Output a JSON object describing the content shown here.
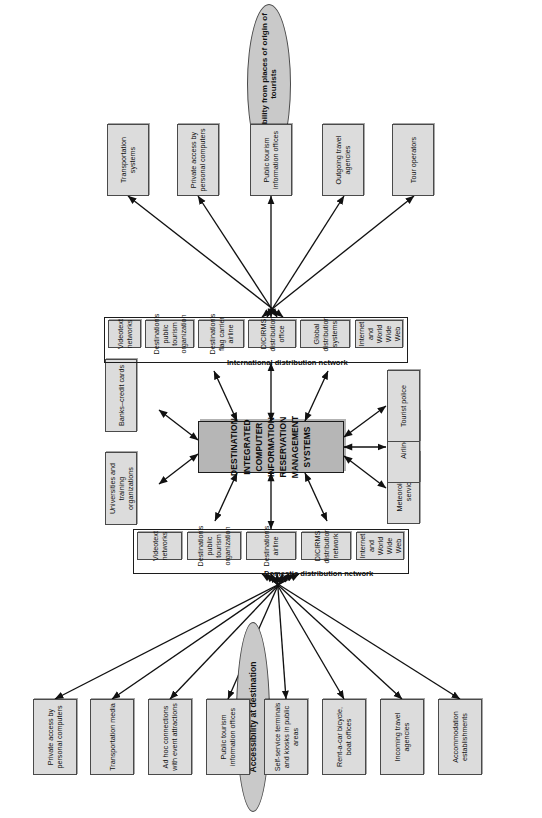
{
  "diagram": {
    "hub": {
      "label": "DESTINATION INTEGRATED COMPUTER INFORMATION RESERVATION MANAGEMENT SYSTEMS",
      "fill": "#b6b6b6",
      "stroke": "#1c1c1c"
    },
    "colors": {
      "node_fill": "#dcdcdc",
      "node_stroke": "#4a4a4a",
      "group_stroke": "#1c1c1c",
      "ellipse_fill": "#c9c9c9",
      "arrow": "#111111",
      "background": "#ffffff"
    },
    "ellipses": [
      {
        "id": "accessibility-at-destination",
        "label": "Accessibility at destination"
      },
      {
        "id": "accessibility-from-origin",
        "label": "Accessibility from places of origin of tourists"
      }
    ],
    "groups": [
      {
        "id": "domestic-distribution-network",
        "label": "Domestic distribution network",
        "members": [
          {
            "id": "domestic-internet",
            "label": "Internet and World Wide Web"
          },
          {
            "id": "domestic-dicirms",
            "label": "DICIRMS distribution network"
          },
          {
            "id": "domestic-airline",
            "label": "Destination's airline"
          },
          {
            "id": "domestic-public-tourism-org",
            "label": "Destination's public tourism organization"
          },
          {
            "id": "domestic-videotext",
            "label": "Videotext networks"
          }
        ]
      },
      {
        "id": "international-distribution-network",
        "label": "International distribution network",
        "members": [
          {
            "id": "intl-internet",
            "label": "Internet and World Wide Web"
          },
          {
            "id": "intl-gds",
            "label": "Global distribution systems"
          },
          {
            "id": "intl-dicirms",
            "label": "DICIRMS distribution office"
          },
          {
            "id": "intl-flag-carrier",
            "label": "Destination's flag carrier airline"
          },
          {
            "id": "intl-public-tourism-org",
            "label": "Destination's public tourism organization"
          },
          {
            "id": "intl-videotext",
            "label": "Videotext networks"
          }
        ]
      }
    ],
    "destination_side_nodes": [
      {
        "id": "accommodation-establishments",
        "label": "Accommodation establishments"
      },
      {
        "id": "incoming-travel-agencies",
        "label": "Incoming travel agencies"
      },
      {
        "id": "rent-a-car-offices",
        "label": "Rent-a-car bicycle, boat offices"
      },
      {
        "id": "self-service-terminals",
        "label": "Self-service terminals and kiosks in public areas"
      },
      {
        "id": "public-tourism-information-offices",
        "label": "Public tourism information offices"
      },
      {
        "id": "ad-hoc-connections",
        "label": "Ad hoc connections with event attractions"
      },
      {
        "id": "transportation-media",
        "label": "Transportation media"
      },
      {
        "id": "private-access-pc-destination",
        "label": "Private access by personal computers"
      }
    ],
    "origin_side_nodes": [
      {
        "id": "tour-operators",
        "label": "Tour operators"
      },
      {
        "id": "outgoing-travel-agencies",
        "label": "Outgoing travel agencies"
      },
      {
        "id": "public-tourism-information-offices-origin",
        "label": "Public tourism information offices"
      },
      {
        "id": "private-access-pc-origin",
        "label": "Private access by personal computers"
      },
      {
        "id": "transportation-systems",
        "label": "Transportation systems"
      }
    ],
    "top_nodes": [
      {
        "id": "universities-and-training",
        "label": "Universities and training organizations"
      },
      {
        "id": "banks-credit-cards",
        "label": "Banks–credit cards"
      }
    ],
    "bottom_nodes": [
      {
        "id": "meteorological-services",
        "label": "Meteorological services"
      },
      {
        "id": "airlines",
        "label": "Airlines"
      },
      {
        "id": "tourist-police",
        "label": "Tourist police"
      }
    ]
  }
}
